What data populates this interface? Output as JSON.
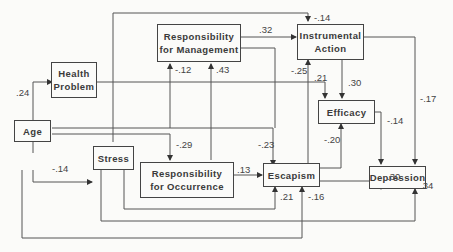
{
  "diagram": {
    "type": "path-diagram",
    "nodes": [
      {
        "id": "health",
        "label_1": "Health",
        "label_2": "Problem"
      },
      {
        "id": "age",
        "label_1": "Age"
      },
      {
        "id": "stress",
        "label_1": "Stress"
      },
      {
        "id": "resp_mgmt",
        "label_1": "Responsibility",
        "label_2": "for Management"
      },
      {
        "id": "resp_occ",
        "label_1": "Responsibility",
        "label_2": "for Occurrence"
      },
      {
        "id": "instrumental",
        "label_1": "Instrumental",
        "label_2": "Action"
      },
      {
        "id": "efficacy",
        "label_1": "Efficacy"
      },
      {
        "id": "escapism",
        "label_1": "Escapism"
      },
      {
        "id": "depression",
        "label_1": "Depression"
      }
    ],
    "edges": [
      {
        "from": "age",
        "to": "health",
        "coef": ".24"
      },
      {
        "from": "age",
        "to": "stress",
        "coef": "-.14"
      },
      {
        "from": "age",
        "to": "instrumental",
        "coef": "-.14"
      },
      {
        "from": "age",
        "to": "resp_mgmt",
        "coef": "-.12"
      },
      {
        "from": "age",
        "to": "resp_occ",
        "coef": "-.29"
      },
      {
        "from": "age",
        "to": "escapism",
        "coef": "-.23"
      },
      {
        "from": "age",
        "to": "escapism_bottom",
        "coef": "-.16"
      },
      {
        "from": "resp_occ",
        "to": "resp_mgmt",
        "coef": ".43"
      },
      {
        "from": "resp_mgmt",
        "to": "instrumental",
        "coef": ".32"
      },
      {
        "from": "escapism",
        "to": "instrumental",
        "coef": "-.25"
      },
      {
        "from": "health",
        "to": "efficacy",
        "coef": ".21"
      },
      {
        "from": "instrumental",
        "to": "efficacy",
        "coef": ".30"
      },
      {
        "from": "instrumental",
        "to": "depression",
        "coef": "-.17"
      },
      {
        "from": "efficacy",
        "to": "depression",
        "coef": "-.14"
      },
      {
        "from": "escapism",
        "to": "efficacy",
        "coef": "-.20"
      },
      {
        "from": "resp_occ",
        "to": "escapism",
        "coef": ".13"
      },
      {
        "from": "escapism",
        "to": "depression",
        "coef": ".30"
      },
      {
        "from": "stress",
        "to": "escapism",
        "coef": ".21"
      },
      {
        "from": "stress",
        "to": "depression",
        "coef": ".34"
      }
    ]
  }
}
